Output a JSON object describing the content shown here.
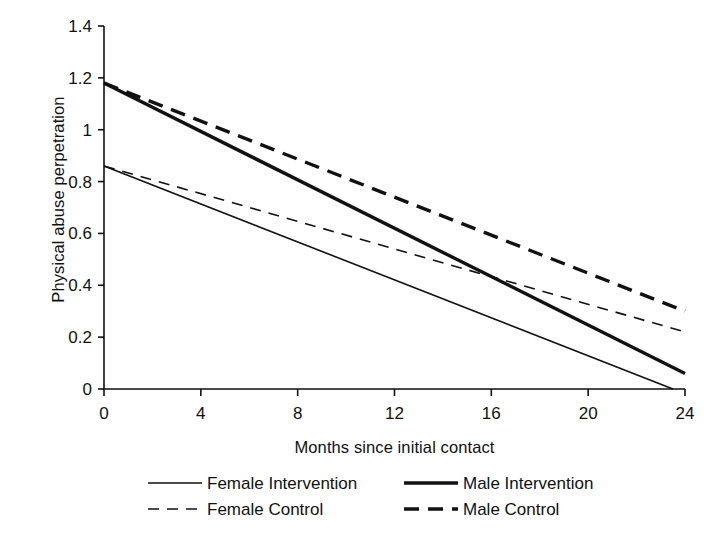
{
  "chart_data": {
    "type": "line",
    "title": "",
    "xlabel": "Months since initial contact",
    "ylabel": "Physical abuse perpetration",
    "xlim": [
      0,
      24
    ],
    "ylim": [
      0,
      1.4
    ],
    "xticks": [
      "0",
      "4",
      "8",
      "12",
      "16",
      "20",
      "24"
    ],
    "xtick_values": [
      0,
      4,
      8,
      12,
      16,
      20,
      24
    ],
    "yticks": [
      "0",
      "0.2",
      "0.4",
      "0.6",
      "0.8",
      "1",
      "1.2",
      "1.4"
    ],
    "ytick_values": [
      0,
      0.2,
      0.4,
      0.6,
      0.8,
      1,
      1.2,
      1.4
    ],
    "grid": false,
    "legend_position": "bottom",
    "x": [
      0,
      24
    ],
    "series": [
      {
        "name": "Female Intervention",
        "style": "solid",
        "width": "thin",
        "color": "#111111",
        "x": [
          0,
          23.5
        ],
        "values": [
          0.86,
          0.0
        ]
      },
      {
        "name": "Male Intervention",
        "style": "solid",
        "width": "thick",
        "color": "#111111",
        "x": [
          0,
          24
        ],
        "values": [
          1.18,
          0.06
        ]
      },
      {
        "name": "Female Control",
        "style": "dashed",
        "width": "thin",
        "color": "#111111",
        "x": [
          0,
          24
        ],
        "values": [
          0.86,
          0.22
        ]
      },
      {
        "name": "Male Control",
        "style": "dashed",
        "width": "thick",
        "color": "#111111",
        "x": [
          0,
          24
        ],
        "values": [
          1.18,
          0.3
        ]
      }
    ]
  },
  "axes": {
    "y_title": "Physical abuse perpetration",
    "x_title": "Months since initial contact",
    "y_tick_labels": [
      "1.4",
      "1.2",
      "1",
      "0.8",
      "0.6",
      "0.4",
      "0.2",
      "0"
    ],
    "x_tick_labels": [
      "0",
      "4",
      "8",
      "12",
      "16",
      "20",
      "24"
    ]
  },
  "legend": {
    "items": [
      {
        "label": "Female Intervention",
        "style": "solid",
        "width": "thin"
      },
      {
        "label": "Male Intervention",
        "style": "solid",
        "width": "thick"
      },
      {
        "label": "Female Control",
        "style": "dashed",
        "width": "thin"
      },
      {
        "label": "Male Control",
        "style": "dashed",
        "width": "thick"
      }
    ]
  },
  "colors": {
    "ink": "#111111",
    "background": "#ffffff"
  }
}
